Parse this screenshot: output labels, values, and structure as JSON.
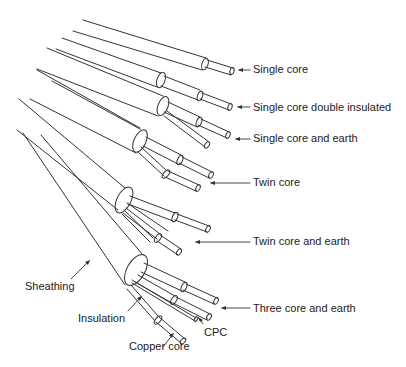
{
  "labels": {
    "single_core": "Single core",
    "single_core_double_insulated": "Single core double insulated",
    "single_core_and_earth": "Single core and earth",
    "twin_core": "Twin core",
    "twin_core_and_earth": "Twin core and earth",
    "three_core_and_earth": "Three core and earth",
    "sheathing": "Sheathing",
    "insulation": "Insulation",
    "copper_core": "Copper core",
    "cpc": "CPC"
  },
  "colors": {
    "line": "#333333",
    "text": "#222222",
    "background": "#ffffff"
  }
}
